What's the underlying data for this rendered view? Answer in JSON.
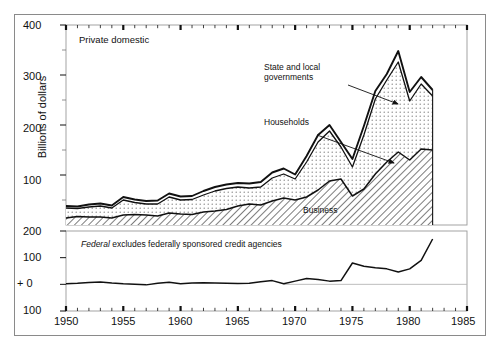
{
  "chart_data": {
    "type": "area",
    "title": "",
    "ylabel": "Billions of dollars",
    "xlabel": "",
    "xlim": [
      1950,
      1985
    ],
    "xticks": [
      1950,
      1955,
      1960,
      1965,
      1970,
      1975,
      1980,
      1985
    ],
    "xtick_labels": [
      "1950",
      "1955",
      "1960",
      "1965",
      "1970",
      "1975",
      "1980",
      "1985"
    ],
    "minor_tick_interval": 1,
    "grid": false,
    "legend_position": "inline-annotations",
    "panels": [
      {
        "name": "private-domestic",
        "label": "Private domestic",
        "type": "stacked-area",
        "ylim": [
          0,
          400
        ],
        "yticks": [
          100,
          200,
          300,
          400
        ],
        "ytick_labels": [
          "100",
          "200",
          "300",
          "400"
        ],
        "minor_yticks": [
          50,
          150,
          250,
          350
        ],
        "x": [
          1950,
          1951,
          1952,
          1953,
          1954,
          1955,
          1956,
          1957,
          1958,
          1959,
          1960,
          1961,
          1962,
          1963,
          1964,
          1965,
          1966,
          1967,
          1968,
          1969,
          1970,
          1971,
          1972,
          1973,
          1974,
          1975,
          1976,
          1977,
          1978,
          1979,
          1980,
          1981,
          1982
        ],
        "series": [
          {
            "name": "Business",
            "fill": "diagonal-hatch",
            "values": [
              14,
              17,
              16,
              16,
              14,
              20,
              21,
              20,
              18,
              24,
              22,
              21,
              26,
              28,
              31,
              38,
              42,
              40,
              48,
              54,
              50,
              56,
              70,
              88,
              92,
              58,
              72,
              102,
              126,
              146,
              130,
              152,
              150
            ]
          },
          {
            "name": "Households",
            "fill": "dotted",
            "values": [
              20,
              16,
              20,
              22,
              20,
              30,
              24,
              22,
              24,
              32,
              28,
              30,
              34,
              40,
              42,
              38,
              32,
              36,
              46,
              48,
              42,
              70,
              96,
              100,
              64,
              58,
              108,
              150,
              164,
              180,
              118,
              130,
              108
            ]
          },
          {
            "name": "State and local governments",
            "fill": "white-band",
            "values": [
              4,
              4,
              5,
              5,
              5,
              6,
              6,
              6,
              7,
              7,
              7,
              7,
              8,
              8,
              8,
              8,
              9,
              10,
              11,
              11,
              9,
              12,
              14,
              12,
              10,
              16,
              18,
              16,
              12,
              22,
              18,
              14,
              12
            ]
          }
        ],
        "totals": [
          38,
          37,
          41,
          43,
          39,
          56,
          51,
          48,
          49,
          63,
          57,
          58,
          68,
          76,
          81,
          84,
          83,
          86,
          105,
          113,
          101,
          138,
          180,
          200,
          166,
          132,
          198,
          268,
          302,
          348,
          266,
          296,
          270
        ],
        "annotations": [
          {
            "text": "Private domestic",
            "kind": "panel-label"
          },
          {
            "text": "State and local governments",
            "kind": "leader-arrow",
            "points_to": "top-band"
          },
          {
            "text": "Households",
            "kind": "leader-arrow",
            "points_to": "middle-band"
          },
          {
            "text": "Business",
            "kind": "inline",
            "points_to": "bottom-band"
          }
        ]
      },
      {
        "name": "federal",
        "label": "Federal excludes federally sponsored credit agencies",
        "label_italic_word": "Federal",
        "type": "line",
        "ylim": [
          -100,
          200
        ],
        "yticks": [
          200,
          100,
          0,
          -100
        ],
        "ytick_labels": [
          "200",
          "100",
          "+ 0",
          "100"
        ],
        "zero_line": 0,
        "x": [
          1950,
          1951,
          1952,
          1953,
          1954,
          1955,
          1956,
          1957,
          1958,
          1959,
          1960,
          1961,
          1962,
          1963,
          1964,
          1965,
          1966,
          1967,
          1968,
          1969,
          1970,
          1971,
          1972,
          1973,
          1974,
          1975,
          1976,
          1977,
          1978,
          1979,
          1980,
          1981,
          1982
        ],
        "series": [
          {
            "name": "Federal",
            "values": [
              2,
              4,
              7,
              9,
              5,
              2,
              0,
              -2,
              4,
              8,
              2,
              5,
              6,
              5,
              4,
              3,
              4,
              10,
              14,
              2,
              12,
              22,
              18,
              12,
              14,
              80,
              68,
              62,
              58,
              46,
              58,
              90,
              170
            ]
          }
        ]
      }
    ]
  },
  "axis": {
    "y_title": "Billions of dollars",
    "upper_yticks": [
      "400",
      "300",
      "200",
      "100"
    ],
    "lower_yticks": [
      "200",
      "100",
      "+ 0",
      "100"
    ],
    "xticks": [
      "1950",
      "1955",
      "1960",
      "1965",
      "1970",
      "1975",
      "1980",
      "1985"
    ]
  },
  "labels": {
    "panel_upper": "Private domestic",
    "annot_state_local_line1": "State and local",
    "annot_state_local_line2": "governments",
    "annot_households": "Households",
    "annot_business": "Business",
    "panel_lower_italic": "Federal",
    "panel_lower_rest": " excludes federally sponsored credit agencies"
  },
  "colors": {
    "ink": "#111111",
    "frame": "#8a8a8a",
    "dotted_fill": "#f2f2f2",
    "background": "#ffffff"
  }
}
